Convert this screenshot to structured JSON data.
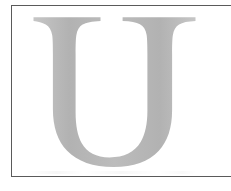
{
  "image": {
    "kind": "scanned-letterform",
    "width": 231,
    "height": 191,
    "background_color": "#ffffff",
    "alt_text": "Large light gray serif capital letter U inside a thin dark rectangular border"
  },
  "frame": {
    "name": "scan-border",
    "stroke_color": "#5a5a5a",
    "stroke_width": 1,
    "left": 11,
    "top": 5,
    "bottom": 177,
    "right_edge_cropped": true
  },
  "glyph": {
    "character": "U",
    "style": "serif-capital",
    "fill_color": "#bcbcbc",
    "shade_light": "#c6c6c6",
    "shade_dark": "#b2b2b2",
    "cap_top": 16,
    "baseline": 167,
    "left_extent": 33,
    "right_extent": 196,
    "left_stem_weight": "thick",
    "right_stem_weight": "thin"
  }
}
